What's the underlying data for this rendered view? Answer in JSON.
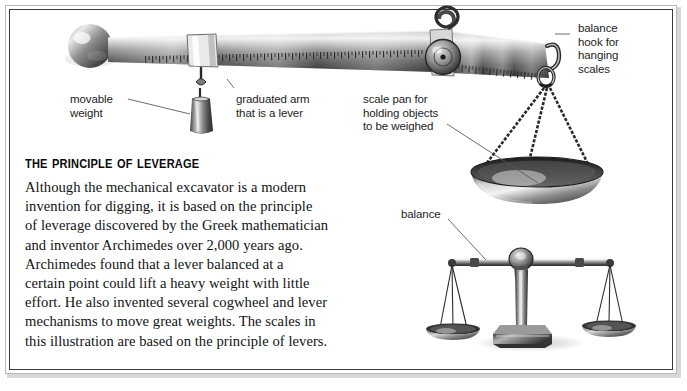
{
  "page": {
    "background_color": "#ffffff",
    "frame_color": "#3a3a3a",
    "frame_outer_color": "#b9b9b9"
  },
  "article": {
    "heading": "The Principle of Leverage",
    "body": "Although the mechanical excavator is a modern\ninvention for digging, it is based on the principle\nof leverage discovered by the Greek mathematician\nand inventor Archimedes over 2,000 years ago.\nArchimedes found that a lever balanced at a\ncertain point could lift a heavy weight with little\neffort.  He also invented several cogwheel and lever\nmechanisms to move great weights.  The scales in\nthis illustration are based on the principle of levers."
  },
  "callouts": [
    {
      "id": "balance-hook",
      "text": "balance\nhook for\nhanging\nscales",
      "x": 578,
      "y": 22
    },
    {
      "id": "movable-weight",
      "text": "movable\nweight",
      "x": 70,
      "y": 93
    },
    {
      "id": "graduated-arm",
      "text": "graduated arm\nthat is a lever",
      "x": 236,
      "y": 93
    },
    {
      "id": "scale-pan",
      "text": "scale pan for\nholding objects\nto be weighed",
      "x": 363,
      "y": 93
    },
    {
      "id": "balance",
      "text": "balance",
      "x": 401,
      "y": 208
    }
  ],
  "illustration": {
    "parts": [
      "knob-ball",
      "graduated-lever-arm",
      "movable-weight",
      "cogwheel-pivot",
      "suspension-loop",
      "balance-hook",
      "hanging-scale-pan",
      "beam-balance"
    ],
    "colors": {
      "metal_dark": "#2b2b2b",
      "metal_mid": "#8a8a8a",
      "metal_light": "#e6e6e6",
      "leader_line": "#4a4a4a"
    }
  }
}
